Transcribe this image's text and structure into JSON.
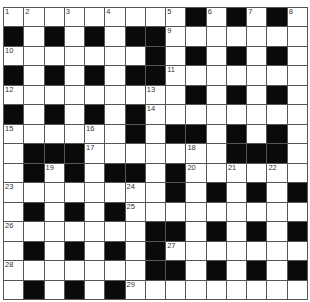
{
  "puzzle": {
    "type": "crossword",
    "rows": 15,
    "cols": 15,
    "colors": {
      "black": "#0a0a0a",
      "white": "#ffffff",
      "line": "#555555"
    },
    "layout": [
      "WWWWWWWWWBWBWBW",
      "BWBWBWBBWWWWWWW",
      "WWWWWWWBWBWBWBW",
      "BWBWBWBBWWWWWWW",
      "WWWWWWWWWBWBWBW",
      "BWBWBWBWWWWWWWW",
      "WWWWWWBWBBWBWBW",
      "WBBBWWWWWWWBBBW",
      "WBWBWBBWBWWWWWW",
      "WWWWWWWWBWBWBWB",
      "WBWBWBWWWWWWWWW",
      "WWWWWWWBBWBWBWB",
      "WBWBWBWBWWWWWWW",
      "WWWWWWWBBWBWBWB",
      "WBWBWBWWWWWWWWW"
    ],
    "numbers": [
      {
        "r": 0,
        "c": 0,
        "n": "1"
      },
      {
        "r": 0,
        "c": 1,
        "n": "2"
      },
      {
        "r": 0,
        "c": 3,
        "n": "3"
      },
      {
        "r": 0,
        "c": 5,
        "n": "4"
      },
      {
        "r": 0,
        "c": 8,
        "n": "5"
      },
      {
        "r": 0,
        "c": 10,
        "n": "6"
      },
      {
        "r": 0,
        "c": 12,
        "n": "7"
      },
      {
        "r": 0,
        "c": 14,
        "n": "8"
      },
      {
        "r": 1,
        "c": 8,
        "n": "9"
      },
      {
        "r": 2,
        "c": 0,
        "n": "10"
      },
      {
        "r": 3,
        "c": 8,
        "n": "11"
      },
      {
        "r": 4,
        "c": 0,
        "n": "12"
      },
      {
        "r": 4,
        "c": 7,
        "n": "13"
      },
      {
        "r": 5,
        "c": 7,
        "n": "14"
      },
      {
        "r": 6,
        "c": 0,
        "n": "15"
      },
      {
        "r": 6,
        "c": 4,
        "n": "16"
      },
      {
        "r": 7,
        "c": 4,
        "n": "17"
      },
      {
        "r": 7,
        "c": 9,
        "n": "18"
      },
      {
        "r": 8,
        "c": 2,
        "n": "19"
      },
      {
        "r": 8,
        "c": 9,
        "n": "20"
      },
      {
        "r": 8,
        "c": 11,
        "n": "21"
      },
      {
        "r": 8,
        "c": 13,
        "n": "22"
      },
      {
        "r": 9,
        "c": 0,
        "n": "23"
      },
      {
        "r": 9,
        "c": 6,
        "n": "24"
      },
      {
        "r": 10,
        "c": 6,
        "n": "25"
      },
      {
        "r": 11,
        "c": 0,
        "n": "26"
      },
      {
        "r": 12,
        "c": 8,
        "n": "27"
      },
      {
        "r": 13,
        "c": 0,
        "n": "28"
      },
      {
        "r": 14,
        "c": 6,
        "n": "29"
      }
    ]
  }
}
